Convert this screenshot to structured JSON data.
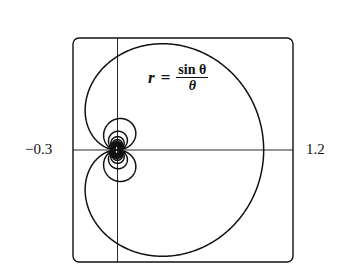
{
  "chart_data": {
    "type": "line",
    "subtype": "polar",
    "title": "",
    "equation": {
      "lhs": "r",
      "equals": "=",
      "numerator": "sin θ",
      "denominator": "θ"
    },
    "function": "r = sin(theta)/theta",
    "theta_range": [
      -40,
      40
    ],
    "xlim": [
      -0.3,
      1.2
    ],
    "ylim": [
      -0.76,
      0.76
    ],
    "x_tick_labels": [
      "-0.3",
      "1.2"
    ],
    "xlabel": "",
    "ylabel": "",
    "grid": false,
    "axes_through_origin": true,
    "frame": "rounded-rectangle",
    "line_color": "#111111",
    "legend": null
  },
  "labels": {
    "xmin": "−0.3",
    "xmax": "1.2",
    "lhs": "r",
    "eq": "=",
    "num": "sin θ",
    "den": "θ"
  }
}
